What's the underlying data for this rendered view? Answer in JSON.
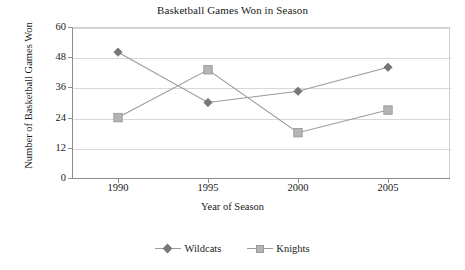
{
  "chart_data": {
    "type": "line",
    "title": "Basketball Games Won in Season",
    "xlabel": "Year of Season",
    "ylabel": "Number of Basketball Games Won",
    "categories": [
      "1990",
      "1995",
      "2000",
      "2005"
    ],
    "x": [
      1990,
      1995,
      2000,
      2005
    ],
    "series": [
      {
        "name": "Wildcats",
        "marker": "diamond",
        "color": "#777777",
        "values": [
          50,
          30,
          34.5,
          44
        ]
      },
      {
        "name": "Knights",
        "marker": "square",
        "color": "#b4b4b4",
        "values": [
          24,
          43,
          18,
          27
        ]
      }
    ],
    "yticks": [
      0,
      12,
      24,
      36,
      48,
      60
    ],
    "ytick_labels": [
      "0",
      "12",
      "24",
      "36",
      "48",
      "60"
    ],
    "ylim": [
      0,
      60
    ],
    "grid": "horizontal",
    "legend_position": "bottom",
    "line_color": "#9a9a9a"
  },
  "legend": {
    "entries": [
      {
        "label": "Wildcats",
        "marker": "diamond-marker"
      },
      {
        "label": "Knights",
        "marker": "square-marker"
      }
    ]
  }
}
